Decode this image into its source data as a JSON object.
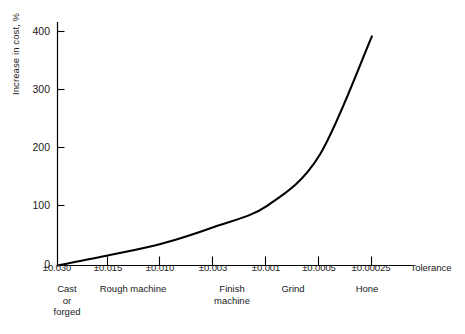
{
  "chart_data": {
    "type": "line",
    "title": "",
    "xlabel": "Tolerance",
    "ylabel": "Increase in cost, %",
    "ylim": [
      0,
      420
    ],
    "yticks": [
      0,
      100,
      200,
      300,
      400
    ],
    "ytick_labels": [
      "0",
      "100",
      "200",
      "300",
      "400"
    ],
    "grid": false,
    "legend": null,
    "categories": [
      "±0.030",
      "±0.015",
      "±0.010",
      "±0.003",
      "±0.001",
      "±0.0005",
      "±0.00025"
    ],
    "values": [
      0,
      18,
      38,
      67,
      103,
      190,
      395
    ],
    "series": [
      {
        "name": "Increase in cost",
        "values": [
          0,
          18,
          38,
          67,
          103,
          190,
          395
        ]
      }
    ],
    "process_groups": [
      {
        "label": "Cast\nor\nforged",
        "lines": [
          "Cast",
          "or",
          "forged"
        ]
      },
      {
        "label": "Rough machine",
        "lines": [
          "Rough machine"
        ]
      },
      {
        "label": "Finish machine",
        "lines": [
          "Finish",
          "machine"
        ]
      },
      {
        "label": "Grind",
        "lines": [
          "Grind"
        ]
      },
      {
        "label": "Hone",
        "lines": [
          "Hone"
        ]
      }
    ],
    "axis_name": "Tolerance",
    "line_color": "#000000",
    "axis_color": "#000000"
  },
  "axis": {
    "y_label": "Increase in cost, %",
    "tick_400": "400",
    "tick_300": "300",
    "tick_200": "200",
    "tick_100": "100",
    "tick_0": "0",
    "x_name": "Tolerance",
    "x0": "±0.030",
    "x1": "±0.015",
    "x2": "±0.010",
    "x3": "±0.003",
    "x4": "±0.001",
    "x5": "±0.0005",
    "x6": "±0.00025"
  },
  "processes": {
    "cast_l1": "Cast",
    "cast_l2": "or",
    "cast_l3": "forged",
    "rough": "Rough machine",
    "finish_l1": "Finish",
    "finish_l2": "machine",
    "grind": "Grind",
    "hone": "Hone"
  }
}
